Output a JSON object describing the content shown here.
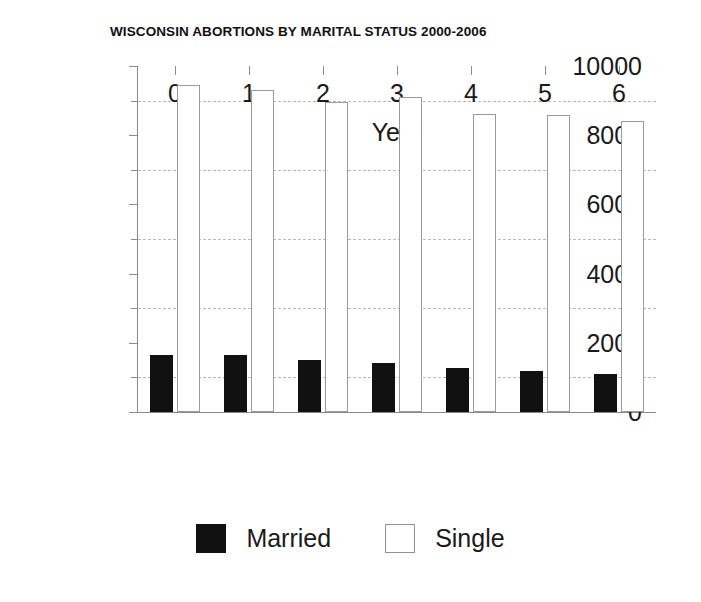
{
  "chart_data": {
    "type": "bar",
    "title": "WISCONSIN ABORTIONS BY MARITAL STATUS 2000-2006",
    "xlabel": "Year",
    "ylabel": "",
    "categories": [
      "0",
      "1",
      "2",
      "3",
      "4",
      "5",
      "6"
    ],
    "series": [
      {
        "name": "Married",
        "color": "#111111",
        "values": [
          1650,
          1640,
          1500,
          1420,
          1280,
          1180,
          1090
        ]
      },
      {
        "name": "Single",
        "color": "#ffffff",
        "values": [
          9450,
          9300,
          8950,
          9100,
          8600,
          8570,
          8400
        ]
      }
    ],
    "ylim": [
      0,
      10000
    ],
    "ytick_labels": [
      "0",
      "2000",
      "4000",
      "6000",
      "8000",
      "10000"
    ],
    "ytick_values": [
      0,
      2000,
      4000,
      6000,
      8000,
      10000
    ],
    "yminor_tick_values": [
      1000,
      3000,
      5000,
      7000,
      9000
    ],
    "gridline_values": [
      1000,
      3000,
      5000,
      7000,
      9000
    ],
    "grid": true,
    "grid_style": "dashed",
    "legend_position": "bottom",
    "legend_entries": [
      "Married",
      "Single"
    ]
  }
}
